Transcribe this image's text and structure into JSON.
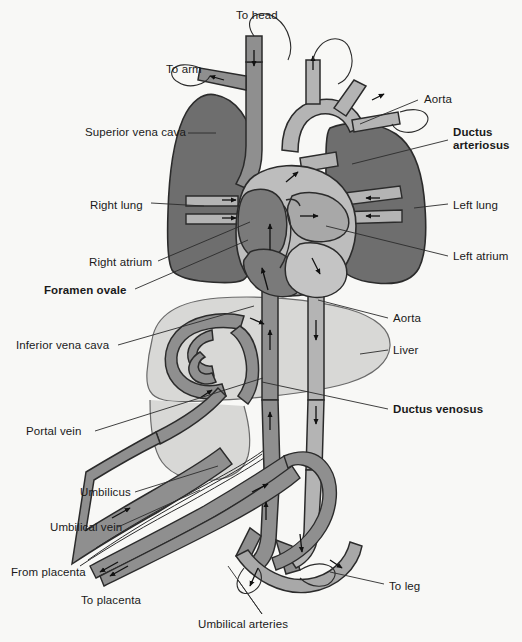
{
  "figure": {
    "background_color": "#f8f8f6",
    "colors": {
      "lung": "#6e6e6e",
      "lung_stroke": "#2b2b2b",
      "vessel_deoxy": "#8f8f8f",
      "vessel_oxy": "#b4b4b4",
      "heart_dark": "#7a7a7a",
      "heart_light": "#bdbdbd",
      "liver": "#d8d8d6",
      "outline": "#2b2b2b",
      "leader_line": "#2b2b2b",
      "text": "#1a1a1a"
    }
  },
  "labels": [
    {
      "id": "to-head",
      "text": "To head",
      "bold": false,
      "x": 236,
      "y": 9,
      "align": "left"
    },
    {
      "id": "to-arm",
      "text": "To arm",
      "bold": false,
      "x": 166,
      "y": 63,
      "align": "left"
    },
    {
      "id": "aorta-top",
      "text": "Aorta",
      "bold": false,
      "x": 424,
      "y": 96,
      "align": "left"
    },
    {
      "id": "superior-vena-cava",
      "text": "Superior vena cava",
      "bold": false,
      "x": 85,
      "y": 127,
      "align": "left"
    },
    {
      "id": "ductus-arteriosus",
      "text": "Ductus arteriosus",
      "bold": true,
      "x": 453,
      "y": 126,
      "align": "left"
    },
    {
      "id": "right-lung",
      "text": "Right lung",
      "bold": false,
      "x": 90,
      "y": 198,
      "align": "left"
    },
    {
      "id": "left-lung",
      "text": "Left lung",
      "bold": false,
      "x": 453,
      "y": 200,
      "align": "left"
    },
    {
      "id": "right-atrium",
      "text": "Right atrium",
      "bold": false,
      "x": 89,
      "y": 256,
      "align": "left"
    },
    {
      "id": "left-atrium",
      "text": "Left atrium",
      "bold": false,
      "x": 453,
      "y": 252,
      "align": "left"
    },
    {
      "id": "foramen-ovale",
      "text": "Foramen ovale",
      "bold": true,
      "x": 44,
      "y": 285,
      "align": "left"
    },
    {
      "id": "aorta-lower",
      "text": "Aorta",
      "bold": false,
      "x": 393,
      "y": 315,
      "align": "left"
    },
    {
      "id": "inferior-vena-cava",
      "text": "Inferior vena cava",
      "bold": false,
      "x": 16,
      "y": 340,
      "align": "left"
    },
    {
      "id": "liver",
      "text": "Liver",
      "bold": false,
      "x": 393,
      "y": 347,
      "align": "left"
    },
    {
      "id": "ductus-venosus",
      "text": "Ductus venosus",
      "bold": true,
      "x": 393,
      "y": 405,
      "align": "left"
    },
    {
      "id": "portal-vein",
      "text": "Portal vein",
      "bold": false,
      "x": 26,
      "y": 426,
      "align": "left"
    },
    {
      "id": "umbilicus",
      "text": "Umbilicus",
      "bold": false,
      "x": 80,
      "y": 488,
      "align": "left"
    },
    {
      "id": "umbilical-vein",
      "text": "Umbilical vein",
      "bold": false,
      "x": 50,
      "y": 523,
      "align": "left"
    },
    {
      "id": "from-placenta",
      "text": "From placenta",
      "bold": false,
      "x": 11,
      "y": 568,
      "align": "left"
    },
    {
      "id": "to-placenta",
      "text": "To placenta",
      "bold": false,
      "x": 81,
      "y": 596,
      "align": "left"
    },
    {
      "id": "to-leg",
      "text": "To leg",
      "bold": false,
      "x": 389,
      "y": 582,
      "align": "left"
    },
    {
      "id": "umbilical-arteries",
      "text": "Umbilical arteries",
      "bold": false,
      "x": 198,
      "y": 620,
      "align": "left"
    }
  ],
  "structures": [
    {
      "id": "right-lung",
      "name": "Right lung"
    },
    {
      "id": "left-lung",
      "name": "Left lung"
    },
    {
      "id": "heart",
      "name": "Heart"
    },
    {
      "id": "liver",
      "name": "Liver"
    },
    {
      "id": "aorta",
      "name": "Aorta"
    },
    {
      "id": "vena-cava",
      "name": "Vena cava"
    },
    {
      "id": "umbilical-cord",
      "name": "Umbilical cord"
    }
  ]
}
